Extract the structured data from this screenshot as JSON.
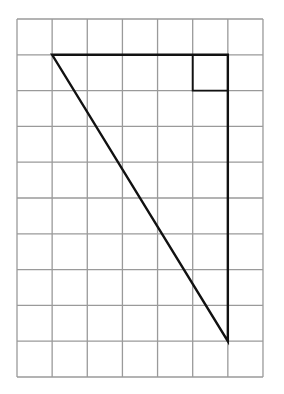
{
  "diagram": {
    "type": "grid-triangle",
    "grid": {
      "columns": 7,
      "rows": 10,
      "origin_px": [
        17,
        19
      ],
      "cell_width_px": 35.14,
      "cell_height_px": 35.8,
      "line_color": "#9a9a9a",
      "line_width": 1.3
    },
    "triangle": {
      "vertices_grid": [
        [
          1,
          1
        ],
        [
          6,
          1
        ],
        [
          6,
          9
        ]
      ],
      "stroke_color": "#111111",
      "stroke_width": 2.4,
      "right_angle_vertex_grid": [
        6,
        1
      ],
      "right_angle_marker": {
        "cell_grid": [
          5,
          1
        ],
        "size_cells": 1
      },
      "legs_units": {
        "horizontal": 5,
        "vertical": 8
      }
    }
  }
}
